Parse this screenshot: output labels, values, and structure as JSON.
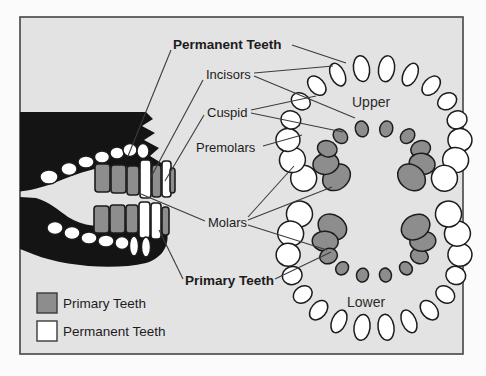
{
  "figure": {
    "labels": {
      "permanent_teeth": "Permanent Teeth",
      "incisors": "Incisors",
      "cuspid": "Cuspid",
      "premolars": "Premolars",
      "molars": "Molars",
      "primary_teeth": "Primary Teeth",
      "upper": "Upper",
      "lower": "Lower"
    },
    "legend": {
      "items": [
        {
          "label": "Primary Teeth",
          "swatch": "#8d8d8d"
        },
        {
          "label": "Permanent Teeth",
          "swatch": "#ffffff"
        }
      ]
    },
    "colors": {
      "primary_tooth": "#8d8d8d",
      "permanent_tooth": "#ffffff",
      "tooth_outline": "#1c1c1c",
      "background": "#e3e3e3",
      "jaw_silhouette": "#141414",
      "leader_line": "#3c3c3c",
      "frame_border": "#4f4f4f"
    }
  }
}
